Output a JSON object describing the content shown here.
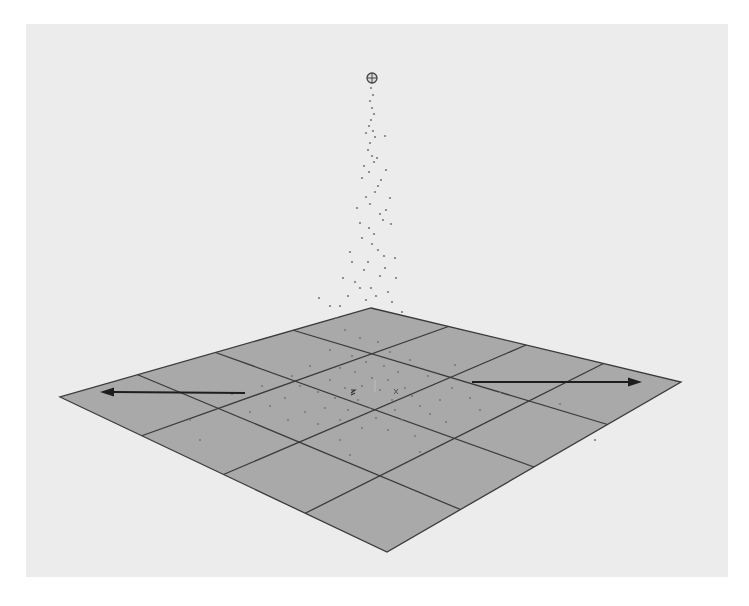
{
  "viewport": {
    "x": 26,
    "y": 24,
    "width": 702,
    "height": 553,
    "background": "#ececec"
  },
  "ground_plane": {
    "divisions": 4,
    "fill": "#a9a9a9",
    "line_color": "#3a3a3a",
    "corners": {
      "top": [
        371,
        308
      ],
      "right": [
        681,
        382
      ],
      "bottom": [
        387,
        552
      ],
      "left": [
        60,
        397
      ]
    }
  },
  "emitter": {
    "icon": "crosshair-circle-icon",
    "x": 372,
    "y": 78,
    "r": 5,
    "color": "#444444"
  },
  "force_arrows": [
    {
      "name": "force-arrow-left",
      "from": [
        245,
        393
      ],
      "to": [
        100,
        392
      ],
      "color": "#1e1e1e"
    },
    {
      "name": "force-arrow-right",
      "from": [
        472,
        382
      ],
      "to": [
        642,
        382
      ],
      "color": "#1e1e1e"
    }
  ],
  "axis_origin": {
    "x": 375,
    "y": 392
  },
  "particles": {
    "color": "#7a7a7a",
    "points": [
      [
        371,
        88
      ],
      [
        373,
        95
      ],
      [
        370,
        101
      ],
      [
        372,
        108
      ],
      [
        374,
        114
      ],
      [
        371,
        120
      ],
      [
        369,
        126
      ],
      [
        373,
        131
      ],
      [
        375,
        137
      ],
      [
        366,
        133
      ],
      [
        370,
        143
      ],
      [
        368,
        150
      ],
      [
        385,
        136
      ],
      [
        372,
        156
      ],
      [
        374,
        162
      ],
      [
        377,
        158
      ],
      [
        364,
        166
      ],
      [
        369,
        172
      ],
      [
        381,
        180
      ],
      [
        386,
        170
      ],
      [
        362,
        178
      ],
      [
        378,
        186
      ],
      [
        375,
        192
      ],
      [
        390,
        198
      ],
      [
        366,
        197
      ],
      [
        370,
        204
      ],
      [
        386,
        210
      ],
      [
        357,
        208
      ],
      [
        380,
        214
      ],
      [
        383,
        220
      ],
      [
        360,
        223
      ],
      [
        369,
        228
      ],
      [
        391,
        224
      ],
      [
        374,
        234
      ],
      [
        362,
        238
      ],
      [
        372,
        244
      ],
      [
        378,
        250
      ],
      [
        350,
        252
      ],
      [
        384,
        256
      ],
      [
        368,
        262
      ],
      [
        395,
        258
      ],
      [
        364,
        270
      ],
      [
        380,
        276
      ],
      [
        355,
        282
      ],
      [
        371,
        288
      ],
      [
        388,
        292
      ],
      [
        348,
        296
      ],
      [
        366,
        300
      ],
      [
        392,
        302
      ],
      [
        340,
        306
      ],
      [
        376,
        296
      ],
      [
        360,
        288
      ],
      [
        385,
        268
      ],
      [
        352,
        262
      ],
      [
        396,
        278
      ],
      [
        343,
        278
      ],
      [
        330,
        306
      ],
      [
        319,
        298
      ],
      [
        402,
        312
      ],
      [
        336,
        318
      ]
    ],
    "ground_points": [
      [
        345,
        330
      ],
      [
        360,
        338
      ],
      [
        378,
        342
      ],
      [
        390,
        352
      ],
      [
        352,
        356
      ],
      [
        366,
        362
      ],
      [
        384,
        366
      ],
      [
        340,
        368
      ],
      [
        398,
        372
      ],
      [
        355,
        372
      ],
      [
        372,
        378
      ],
      [
        388,
        380
      ],
      [
        330,
        380
      ],
      [
        345,
        388
      ],
      [
        362,
        386
      ],
      [
        380,
        390
      ],
      [
        405,
        388
      ],
      [
        318,
        392
      ],
      [
        335,
        398
      ],
      [
        358,
        400
      ],
      [
        392,
        400
      ],
      [
        412,
        396
      ],
      [
        300,
        386
      ],
      [
        325,
        408
      ],
      [
        348,
        410
      ],
      [
        370,
        408
      ],
      [
        395,
        410
      ],
      [
        420,
        406
      ],
      [
        285,
        398
      ],
      [
        305,
        412
      ],
      [
        340,
        420
      ],
      [
        376,
        418
      ],
      [
        402,
        420
      ],
      [
        430,
        414
      ],
      [
        270,
        406
      ],
      [
        318,
        424
      ],
      [
        362,
        428
      ],
      [
        388,
        430
      ],
      [
        446,
        422
      ],
      [
        292,
        376
      ],
      [
        428,
        376
      ],
      [
        452,
        388
      ],
      [
        262,
        386
      ],
      [
        310,
        366
      ],
      [
        440,
        400
      ],
      [
        470,
        398
      ],
      [
        250,
        412
      ],
      [
        480,
        410
      ],
      [
        232,
        394
      ],
      [
        500,
        392
      ],
      [
        410,
        360
      ],
      [
        330,
        350
      ],
      [
        455,
        365
      ],
      [
        288,
        420
      ],
      [
        415,
        436
      ],
      [
        340,
        440
      ],
      [
        190,
        420
      ],
      [
        560,
        404
      ],
      [
        595,
        440
      ],
      [
        200,
        440
      ],
      [
        420,
        452
      ],
      [
        350,
        455
      ]
    ]
  }
}
